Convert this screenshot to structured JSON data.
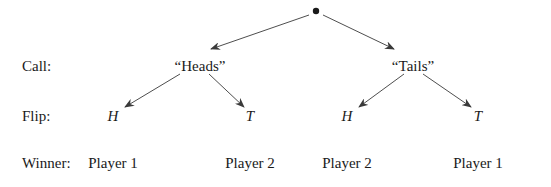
{
  "diagram": {
    "type": "game-tree",
    "root": {
      "id": "root",
      "x": 316,
      "y": 11
    },
    "row_labels": [
      {
        "id": "call",
        "text": "Call:",
        "x": 22,
        "y": 66
      },
      {
        "id": "flip",
        "text": "Flip:",
        "x": 22,
        "y": 116
      },
      {
        "id": "winner",
        "text": "Winner:",
        "x": 22,
        "y": 163
      }
    ],
    "nodes": {
      "call_heads": {
        "text": "“Heads”",
        "x": 200,
        "y": 66
      },
      "call_tails": {
        "text": "“Tails”",
        "x": 413,
        "y": 66
      },
      "flip_heads_h": {
        "text": "H",
        "x": 113,
        "y": 116
      },
      "flip_heads_t": {
        "text": "T",
        "x": 250,
        "y": 116
      },
      "flip_tails_h": {
        "text": "H",
        "x": 347,
        "y": 116
      },
      "flip_tails_t": {
        "text": "T",
        "x": 478,
        "y": 116
      }
    },
    "winners": [
      {
        "text": "Player 1",
        "x": 113,
        "y": 163
      },
      {
        "text": "Player 2",
        "x": 250,
        "y": 163
      },
      {
        "text": "Player 2",
        "x": 347,
        "y": 163
      },
      {
        "text": "Player 1",
        "x": 478,
        "y": 163
      }
    ],
    "edges": [
      {
        "from": "root",
        "to": "call_heads",
        "x1": 309,
        "y1": 15,
        "x2": 211,
        "y2": 49
      },
      {
        "from": "root",
        "to": "call_tails",
        "x1": 323,
        "y1": 15,
        "x2": 394,
        "y2": 49
      },
      {
        "from": "call_heads",
        "to": "flip_heads_h",
        "x1": 180,
        "y1": 74,
        "x2": 125,
        "y2": 107
      },
      {
        "from": "call_heads",
        "to": "flip_heads_t",
        "x1": 209,
        "y1": 74,
        "x2": 244,
        "y2": 107
      },
      {
        "from": "call_tails",
        "to": "flip_tails_h",
        "x1": 404,
        "y1": 74,
        "x2": 359,
        "y2": 107
      },
      {
        "from": "call_tails",
        "to": "flip_tails_t",
        "x1": 423,
        "y1": 74,
        "x2": 471,
        "y2": 107
      }
    ],
    "colors": {
      "ink": "#1a1a1a",
      "edge": "#3a3a3a",
      "background": "#ffffff"
    }
  }
}
